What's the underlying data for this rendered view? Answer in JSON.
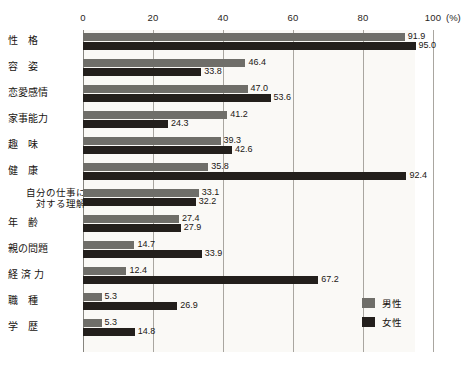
{
  "chart_data": {
    "type": "bar",
    "orientation": "horizontal",
    "title": "",
    "xlabel": "(%)",
    "ylabel": "",
    "xlim": [
      0,
      100
    ],
    "xticks": [
      0,
      20,
      40,
      60,
      80,
      100
    ],
    "xtick_labels": [
      "0",
      "20",
      "40",
      "60",
      "80",
      "100"
    ],
    "unit_label": "(%)",
    "grid": true,
    "legend_position": "right",
    "categories": [
      "性　格",
      "容　姿",
      "恋愛感情",
      "家事能力",
      "趣　味",
      "健　康",
      "自分の仕事に対する理解",
      "年　齢",
      "親の問題",
      "経 済 力",
      "職　種",
      "学　歴"
    ],
    "series": [
      {
        "name": "男性",
        "color": "#6f6e69",
        "values": [
          91.9,
          46.4,
          47.0,
          41.2,
          39.3,
          35.8,
          33.1,
          27.4,
          14.7,
          12.4,
          5.3,
          5.3
        ]
      },
      {
        "name": "女性",
        "color": "#231f1c",
        "values": [
          95.0,
          33.8,
          53.6,
          24.3,
          42.6,
          92.4,
          32.2,
          27.9,
          33.9,
          67.2,
          26.9,
          14.8
        ]
      }
    ]
  },
  "legend": {
    "items": [
      {
        "label": "男性",
        "swatch": "male"
      },
      {
        "label": "女性",
        "swatch": "female"
      }
    ]
  },
  "rows": [
    {
      "label": "性　格",
      "two_line": false,
      "line1": "性　格",
      "line2": "",
      "male": "91.9",
      "female": "95.0",
      "male_v": 91.9,
      "female_v": 95.0
    },
    {
      "label": "容　姿",
      "two_line": false,
      "line1": "容　姿",
      "line2": "",
      "male": "46.4",
      "female": "33.8",
      "male_v": 46.4,
      "female_v": 33.8
    },
    {
      "label": "恋愛感情",
      "two_line": false,
      "line1": "恋愛感情",
      "line2": "",
      "male": "47.0",
      "female": "53.6",
      "male_v": 47.0,
      "female_v": 53.6
    },
    {
      "label": "家事能力",
      "two_line": false,
      "line1": "家事能力",
      "line2": "",
      "male": "41.2",
      "female": "24.3",
      "male_v": 41.2,
      "female_v": 24.3
    },
    {
      "label": "趣　味",
      "two_line": false,
      "line1": "趣　味",
      "line2": "",
      "male": "39.3",
      "female": "42.6",
      "male_v": 39.3,
      "female_v": 42.6
    },
    {
      "label": "健　康",
      "two_line": false,
      "line1": "健　康",
      "line2": "",
      "male": "35.8",
      "female": "92.4",
      "male_v": 35.8,
      "female_v": 92.4
    },
    {
      "label": "自分の仕事に対する理解",
      "two_line": true,
      "line1": "自分の仕事に",
      "line2": "対する理解",
      "male": "33.1",
      "female": "32.2",
      "male_v": 33.1,
      "female_v": 32.2
    },
    {
      "label": "年　齢",
      "two_line": false,
      "line1": "年　齢",
      "line2": "",
      "male": "27.4",
      "female": "27.9",
      "male_v": 27.4,
      "female_v": 27.9
    },
    {
      "label": "親の問題",
      "two_line": false,
      "line1": "親の問題",
      "line2": "",
      "male": "14.7",
      "female": "33.9",
      "male_v": 14.7,
      "female_v": 33.9
    },
    {
      "label": "経 済 力",
      "two_line": false,
      "line1": "経 済 力",
      "line2": "",
      "male": "12.4",
      "female": "67.2",
      "male_v": 12.4,
      "female_v": 67.2
    },
    {
      "label": "職　種",
      "two_line": false,
      "line1": "職　種",
      "line2": "",
      "male": "5.3",
      "female": "26.9",
      "male_v": 5.3,
      "female_v": 26.9
    },
    {
      "label": "学　歴",
      "two_line": false,
      "line1": "学　歴",
      "line2": "",
      "male": "5.3",
      "female": "14.8",
      "male_v": 5.3,
      "female_v": 14.8
    }
  ]
}
